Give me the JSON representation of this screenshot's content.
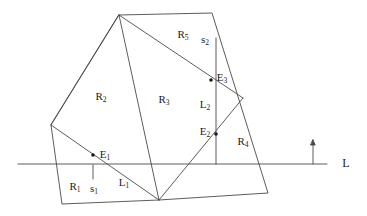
{
  "figure": {
    "stroke_color": "#4a4a4a",
    "text_color": "#1a1a1a",
    "background": "#ffffff",
    "line_label": "L",
    "regions": [
      {
        "id": "R1",
        "base": "R",
        "sub": "1",
        "x": 75,
        "y": 186
      },
      {
        "id": "R2",
        "base": "R",
        "sub": "2",
        "x": 101,
        "y": 96
      },
      {
        "id": "R3",
        "base": "R",
        "sub": "3",
        "x": 164,
        "y": 99
      },
      {
        "id": "R4",
        "base": "R",
        "sub": "4",
        "x": 243,
        "y": 141
      },
      {
        "id": "R5",
        "base": "R",
        "sub": "5",
        "x": 183,
        "y": 34
      }
    ],
    "edge_points": [
      {
        "id": "E1",
        "base": "E",
        "sub": "1",
        "x": 105,
        "y": 154,
        "dot_x": 93,
        "dot_y": 155
      },
      {
        "id": "E2",
        "base": "E",
        "sub": "2",
        "x": 205,
        "y": 131,
        "dot_x": 216,
        "dot_y": 134
      },
      {
        "id": "E3",
        "base": "E",
        "sub": "3",
        "x": 222,
        "y": 77,
        "dot_x": 211,
        "dot_y": 80
      }
    ],
    "segments": [
      {
        "id": "s1",
        "base": "s",
        "sub": "1",
        "x": 94,
        "y": 188
      },
      {
        "id": "s2",
        "base": "s",
        "sub": "2",
        "x": 205,
        "y": 39
      },
      {
        "id": "L1",
        "base": "L",
        "sub": "1",
        "x": 124,
        "y": 182
      },
      {
        "id": "L2",
        "base": "L",
        "sub": "2",
        "x": 205,
        "y": 104
      }
    ],
    "line_label_pos": {
      "x": 346,
      "y": 163
    },
    "horizontal_line": {
      "x1": 18,
      "y1": 164,
      "x2": 327,
      "y2": 164
    },
    "arrow": {
      "x": 313,
      "y_tail": 164,
      "y_head": 140
    },
    "polygon_outer": "119,15 212,13 268,193 159,200 62,204 51,125",
    "chords": [
      {
        "name": "chord-top-to-left",
        "x1": 119,
        "y1": 15,
        "x2": 51,
        "y2": 125
      },
      {
        "name": "chord-left-to-bottom",
        "x1": 51,
        "y1": 125,
        "x2": 159,
        "y2": 200
      },
      {
        "name": "chord-top-to-bottom",
        "x1": 119,
        "y1": 15,
        "x2": 159,
        "y2": 200
      },
      {
        "name": "chord-top-to-right",
        "x1": 119,
        "y1": 15,
        "x2": 243,
        "y2": 98
      },
      {
        "name": "chord-bottom-to-right",
        "x1": 159,
        "y1": 200,
        "x2": 243,
        "y2": 98
      }
    ],
    "vertical_segment": {
      "x": 216,
      "y1": 38,
      "y2": 164
    },
    "tick_segment": {
      "x": 93,
      "y1": 165,
      "y2": 179
    },
    "vertices": [
      {
        "name": "vertex-top",
        "x": 119,
        "y": 15
      },
      {
        "name": "vertex-top-right",
        "x": 212,
        "y": 13
      },
      {
        "name": "vertex-right",
        "x": 243,
        "y": 98
      },
      {
        "name": "vertex-bottom-right",
        "x": 268,
        "y": 193
      },
      {
        "name": "vertex-bottom",
        "x": 159,
        "y": 200
      },
      {
        "name": "vertex-bottom-left",
        "x": 62,
        "y": 204
      },
      {
        "name": "vertex-left",
        "x": 51,
        "y": 125
      }
    ]
  }
}
